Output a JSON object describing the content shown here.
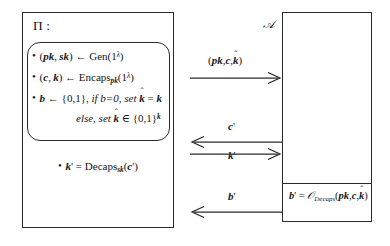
{
  "diagram": {
    "challenger": {
      "title": "Π :",
      "steps": [
        {
          "id": "gen",
          "text": "(pk, sk) ← Gen(1λ)"
        },
        {
          "id": "encaps",
          "text": "(c, k) ← Encaps_pk(1λ)"
        },
        {
          "id": "bit",
          "text": "b ← {0,1}, if b=0, set k̂ = k"
        },
        {
          "id": "else",
          "text": "else, set k̂ ∈ {0,1}^k"
        }
      ],
      "decaps": "k' = Decaps_sk(c')"
    },
    "adversary": {
      "title": "𝒜",
      "oracle_call": "b' = 𝒪_Decaps(pk, c, k̂)"
    },
    "messages": [
      {
        "id": "msg1",
        "label": "(pk, c, k̂)",
        "direction": "right"
      },
      {
        "id": "msg2",
        "label": "c'",
        "direction": "left"
      },
      {
        "id": "msg3",
        "label": "k'",
        "direction": "right"
      },
      {
        "id": "msg4",
        "label": "b'",
        "direction": "left"
      }
    ]
  },
  "colors": {
    "stroke": "#2a2a2e",
    "background": "#ffffff"
  }
}
